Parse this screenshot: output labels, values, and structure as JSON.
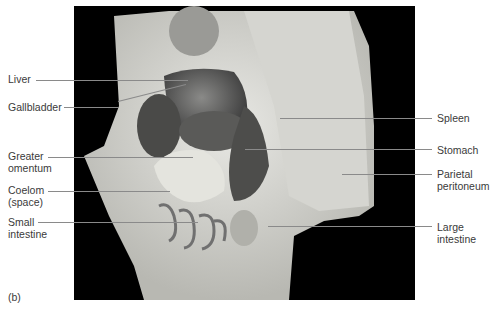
{
  "figure": {
    "panel_label": "(b)",
    "labels_left": [
      {
        "id": "liver",
        "text": "Liver"
      },
      {
        "id": "gallbladder",
        "text": "Gallbladder"
      },
      {
        "id": "greater-omentum",
        "text": "Greater\nomentum"
      },
      {
        "id": "coelom",
        "text": "Coelom\n(space)"
      },
      {
        "id": "small-intestine",
        "text": "Small\nintestine"
      }
    ],
    "labels_right": [
      {
        "id": "spleen",
        "text": "Spleen"
      },
      {
        "id": "stomach",
        "text": "Stomach"
      },
      {
        "id": "parietal-peritoneum",
        "text": "Parietal\nperitoneum"
      },
      {
        "id": "large-intestine",
        "text": "Large\nintestine"
      }
    ]
  }
}
